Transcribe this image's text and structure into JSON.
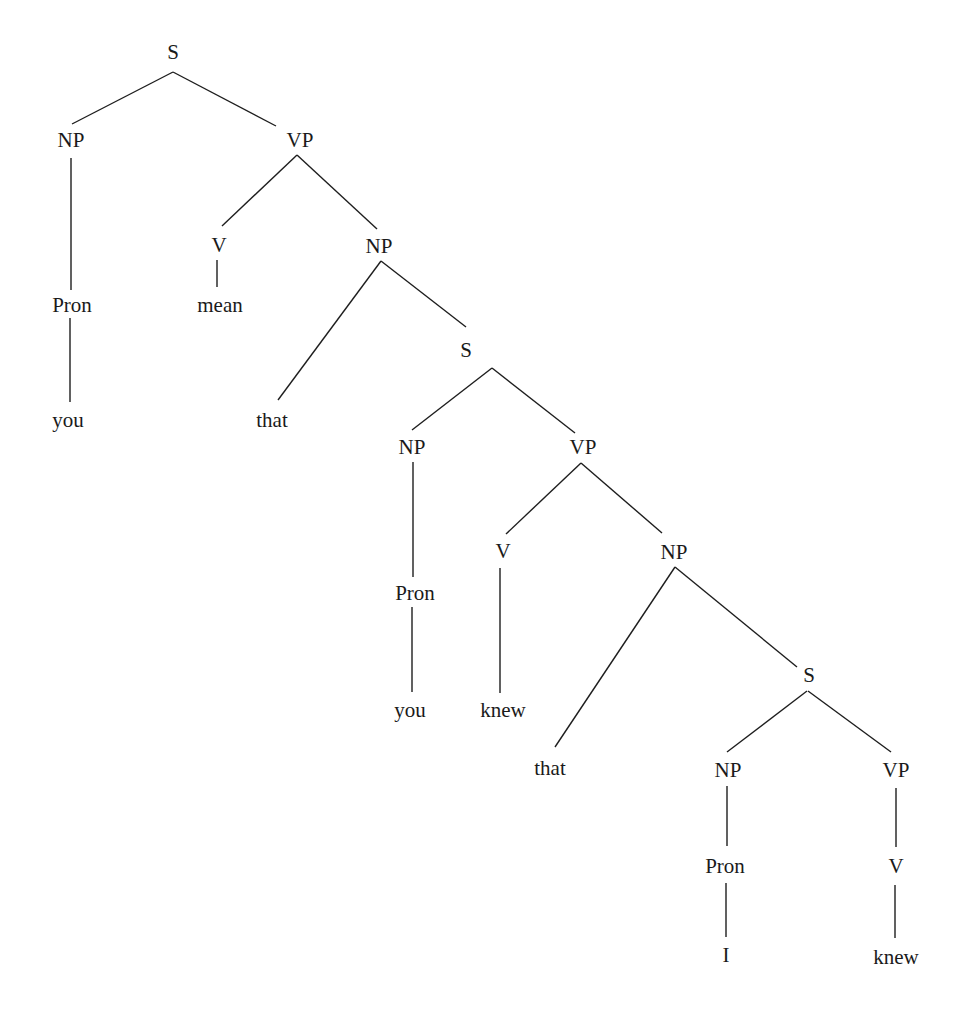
{
  "diagram": {
    "type": "syntax-tree",
    "sentence": "you mean that you knew that I knew",
    "nodes": [
      {
        "id": "s1",
        "label": "S",
        "x": 173,
        "y": 52
      },
      {
        "id": "np1",
        "label": "NP",
        "x": 71,
        "y": 140
      },
      {
        "id": "vp1",
        "label": "VP",
        "x": 300,
        "y": 140
      },
      {
        "id": "pron1",
        "label": "Pron",
        "x": 72,
        "y": 305
      },
      {
        "id": "you1",
        "label": "you",
        "x": 68,
        "y": 420
      },
      {
        "id": "v1",
        "label": "V",
        "x": 219,
        "y": 245
      },
      {
        "id": "mean",
        "label": "mean",
        "x": 220,
        "y": 305
      },
      {
        "id": "np2",
        "label": "NP",
        "x": 379,
        "y": 246
      },
      {
        "id": "that1",
        "label": "that",
        "x": 272,
        "y": 420
      },
      {
        "id": "s2",
        "label": "S",
        "x": 466,
        "y": 350
      },
      {
        "id": "np3",
        "label": "NP",
        "x": 412,
        "y": 447
      },
      {
        "id": "vp2",
        "label": "VP",
        "x": 583,
        "y": 447
      },
      {
        "id": "pron2",
        "label": "Pron",
        "x": 415,
        "y": 593
      },
      {
        "id": "you2",
        "label": "you",
        "x": 410,
        "y": 710
      },
      {
        "id": "v2",
        "label": "V",
        "x": 503,
        "y": 551
      },
      {
        "id": "knew1",
        "label": "knew",
        "x": 503,
        "y": 710
      },
      {
        "id": "np4",
        "label": "NP",
        "x": 674,
        "y": 552
      },
      {
        "id": "that2",
        "label": "that",
        "x": 550,
        "y": 768
      },
      {
        "id": "s3",
        "label": "S",
        "x": 809,
        "y": 675
      },
      {
        "id": "np5",
        "label": "NP",
        "x": 728,
        "y": 770
      },
      {
        "id": "vp3",
        "label": "VP",
        "x": 896,
        "y": 770
      },
      {
        "id": "pron3",
        "label": "Pron",
        "x": 725,
        "y": 866
      },
      {
        "id": "i",
        "label": "I",
        "x": 726,
        "y": 955
      },
      {
        "id": "v3",
        "label": "V",
        "x": 896,
        "y": 866
      },
      {
        "id": "knew2",
        "label": "knew",
        "x": 896,
        "y": 957
      }
    ],
    "edges": [
      {
        "from": "s1",
        "to": "np1",
        "x1": 173,
        "y1": 72,
        "x2": 72,
        "y2": 124
      },
      {
        "from": "s1",
        "to": "vp1",
        "x1": 173,
        "y1": 72,
        "x2": 276,
        "y2": 126
      },
      {
        "from": "np1",
        "to": "pron1",
        "x1": 71,
        "y1": 158,
        "x2": 71,
        "y2": 290
      },
      {
        "from": "pron1",
        "to": "you1",
        "x1": 70,
        "y1": 318,
        "x2": 70,
        "y2": 402
      },
      {
        "from": "vp1",
        "to": "v1",
        "x1": 297,
        "y1": 155,
        "x2": 222,
        "y2": 226
      },
      {
        "from": "v1",
        "to": "mean",
        "x1": 217,
        "y1": 260,
        "x2": 217,
        "y2": 287
      },
      {
        "from": "vp1",
        "to": "np2",
        "x1": 297,
        "y1": 155,
        "x2": 377,
        "y2": 229
      },
      {
        "from": "np2",
        "to": "that1",
        "x1": 381,
        "y1": 261,
        "x2": 278,
        "y2": 400
      },
      {
        "from": "np2",
        "to": "s2",
        "x1": 381,
        "y1": 261,
        "x2": 466,
        "y2": 327
      },
      {
        "from": "s2",
        "to": "np3",
        "x1": 492,
        "y1": 368,
        "x2": 412,
        "y2": 430
      },
      {
        "from": "s2",
        "to": "vp2",
        "x1": 492,
        "y1": 368,
        "x2": 575,
        "y2": 433
      },
      {
        "from": "np3",
        "to": "pron2",
        "x1": 413,
        "y1": 462,
        "x2": 413,
        "y2": 577
      },
      {
        "from": "pron2",
        "to": "you2",
        "x1": 412,
        "y1": 607,
        "x2": 412,
        "y2": 692
      },
      {
        "from": "vp2",
        "to": "v2",
        "x1": 581,
        "y1": 463,
        "x2": 506,
        "y2": 534
      },
      {
        "from": "v2",
        "to": "knew1",
        "x1": 500,
        "y1": 568,
        "x2": 500,
        "y2": 693
      },
      {
        "from": "vp2",
        "to": "np4",
        "x1": 581,
        "y1": 463,
        "x2": 662,
        "y2": 533
      },
      {
        "from": "np4",
        "to": "that2",
        "x1": 675,
        "y1": 567,
        "x2": 555,
        "y2": 747
      },
      {
        "from": "np4",
        "to": "s3",
        "x1": 675,
        "y1": 567,
        "x2": 797,
        "y2": 667
      },
      {
        "from": "s3",
        "to": "np5",
        "x1": 807,
        "y1": 691,
        "x2": 727,
        "y2": 752
      },
      {
        "from": "s3",
        "to": "vp3",
        "x1": 808,
        "y1": 691,
        "x2": 891,
        "y2": 752
      },
      {
        "from": "np5",
        "to": "pron3",
        "x1": 727,
        "y1": 786,
        "x2": 727,
        "y2": 846
      },
      {
        "from": "pron3",
        "to": "i",
        "x1": 726,
        "y1": 883,
        "x2": 726,
        "y2": 937
      },
      {
        "from": "vp3",
        "to": "v3",
        "x1": 896,
        "y1": 788,
        "x2": 896,
        "y2": 847
      },
      {
        "from": "v3",
        "to": "knew2",
        "x1": 895,
        "y1": 885,
        "x2": 895,
        "y2": 938
      }
    ]
  }
}
